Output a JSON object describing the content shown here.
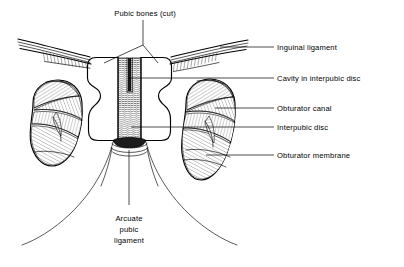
{
  "figure": {
    "background_color": "#ffffff",
    "ink_color": "#000000",
    "width": 404,
    "height": 267
  },
  "labels": {
    "pubic_bones": "Pubic bones (cut)",
    "inguinal_ligament": "Inguinal ligament",
    "cavity": "Cavity in interpubic disc",
    "obturator_canal": "Obturator canal",
    "interpubic_disc": "Interpubic disc",
    "obturator_membrane": "Obturator membrane",
    "arcuate_line1": "Arcuate",
    "arcuate_line2": "pubic",
    "arcuate_line3": "ligament"
  },
  "label_list": [
    {
      "key": "pubic_bones",
      "text": "Pubic bones (cut)",
      "position": "top-center",
      "x": 145,
      "y": 16
    },
    {
      "key": "inguinal_ligament",
      "text": "Inguinal ligament",
      "position": "right",
      "x": 277,
      "y": 48
    },
    {
      "key": "cavity",
      "text": "Cavity in interpubic disc",
      "position": "right",
      "x": 277,
      "y": 80
    },
    {
      "key": "obturator_canal",
      "text": "Obturator canal",
      "position": "right",
      "x": 277,
      "y": 110
    },
    {
      "key": "interpubic_disc",
      "text": "Interpubic disc",
      "position": "right",
      "x": 277,
      "y": 128
    },
    {
      "key": "obturator_membrane",
      "text": "Obturator membrane",
      "position": "right",
      "x": 277,
      "y": 157
    },
    {
      "key": "arcuate_pubic_ligament",
      "text": "Arcuate pubic ligament",
      "position": "bottom-center",
      "x": 128,
      "y": 222
    }
  ],
  "structures": [
    {
      "name": "left-pubic-bone",
      "texture": "stippled-cancellous-bone"
    },
    {
      "name": "right-pubic-bone",
      "texture": "stippled-cancellous-bone"
    },
    {
      "name": "interpubic-disc",
      "texture": "horizontal-fibre-hatching"
    },
    {
      "name": "cavity-in-interpubic-disc",
      "texture": "solid-dark-slit"
    },
    {
      "name": "arcuate-pubic-ligament",
      "texture": "dark-arc"
    },
    {
      "name": "left-inguinal-ligament",
      "texture": "longitudinal-striations"
    },
    {
      "name": "right-inguinal-ligament",
      "texture": "longitudinal-striations"
    },
    {
      "name": "left-obturator-membrane",
      "texture": "crossed-fibre-bands"
    },
    {
      "name": "right-obturator-membrane",
      "texture": "crossed-fibre-bands"
    },
    {
      "name": "left-obturator-canal",
      "texture": "open-gap"
    },
    {
      "name": "right-obturator-canal",
      "texture": "open-gap"
    },
    {
      "name": "left-inferior-pubic-ramus",
      "texture": "plain-outline"
    },
    {
      "name": "right-inferior-pubic-ramus",
      "texture": "plain-outline"
    }
  ]
}
